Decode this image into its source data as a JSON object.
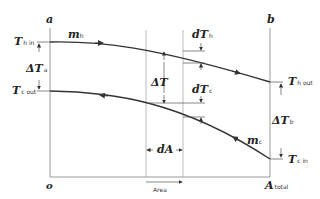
{
  "diagram": {
    "axis_labels": {
      "left_top": "a",
      "right_top": "b",
      "origin": "o",
      "x_end": "A",
      "x_end_sub": "total",
      "x_axis_arrow": "Area"
    },
    "hot_stream": {
      "flow_label": "m",
      "flow_sub": "h",
      "inlet_label": "T",
      "inlet_sub": "h in",
      "outlet_label": "T",
      "outlet_sub": "h out"
    },
    "cold_stream": {
      "flow_label": "m",
      "flow_sub": "c",
      "inlet_label": "T",
      "inlet_sub": "c in",
      "outlet_label": "T",
      "outlet_sub": "c out"
    },
    "differences": {
      "delta_a": "ΔT",
      "delta_a_sub": "a",
      "delta_b": "ΔT",
      "delta_b_sub": "b",
      "delta_mid": "ΔT",
      "dTh": "dT",
      "dTh_sub": "h",
      "dTc": "dT",
      "dTc_sub": "c",
      "dA": "dA"
    },
    "colors": {
      "line": "#333333",
      "axis": "#888888"
    }
  }
}
